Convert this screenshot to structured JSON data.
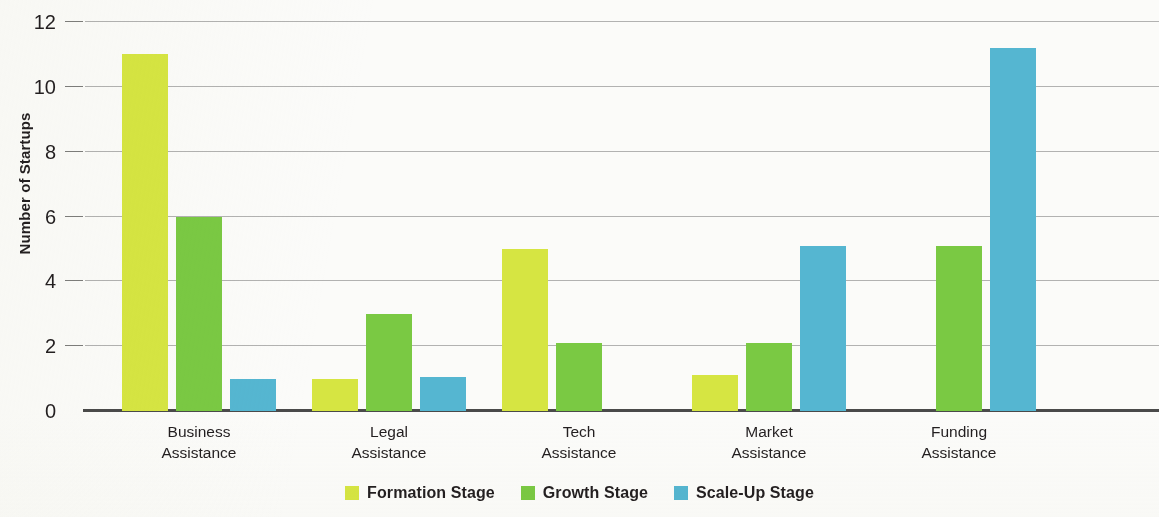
{
  "chart_data": {
    "type": "bar",
    "title": "",
    "subtitle": "",
    "xlabel": "",
    "ylabel": "Number of Startups",
    "ylim": [
      0,
      12
    ],
    "yticks": [
      0,
      2,
      4,
      6,
      8,
      10,
      12
    ],
    "ytick_labels": [
      "0",
      "2",
      "4",
      "6",
      "8",
      "10",
      "12"
    ],
    "grid": true,
    "legend_position": "bottom",
    "categories": [
      "Business\nAssistance",
      "Legal\nAssistance",
      "Tech\nAssistance",
      "Market\nAssistance",
      "Funding\nAssistance"
    ],
    "series": [
      {
        "name": "Formation Stage",
        "color": "#d6e542",
        "values": [
          11,
          1,
          5,
          1.1,
          0
        ]
      },
      {
        "name": "Growth Stage",
        "color": "#7ac943",
        "values": [
          6,
          3,
          2.1,
          2.1,
          5.1
        ]
      },
      {
        "name": "Scale-Up Stage",
        "color": "#55b6d1",
        "values": [
          1,
          1.05,
          0,
          5.1,
          11.2
        ]
      }
    ]
  },
  "axis": {
    "y_title": "Number of Startups"
  },
  "legend": {
    "items": [
      {
        "label": "Formation Stage",
        "color": "#d6e542"
      },
      {
        "label": "Growth Stage",
        "color": "#7ac943"
      },
      {
        "label": "Scale-Up Stage",
        "color": "#55b6d1"
      }
    ]
  },
  "colors": {
    "background": "#fbfbf9",
    "axis": "#4a4a4a",
    "gridline": "#9a9a98",
    "text": "#231f20",
    "formation": "#d6e542",
    "growth": "#7ac943",
    "scaleup": "#55b6d1"
  }
}
